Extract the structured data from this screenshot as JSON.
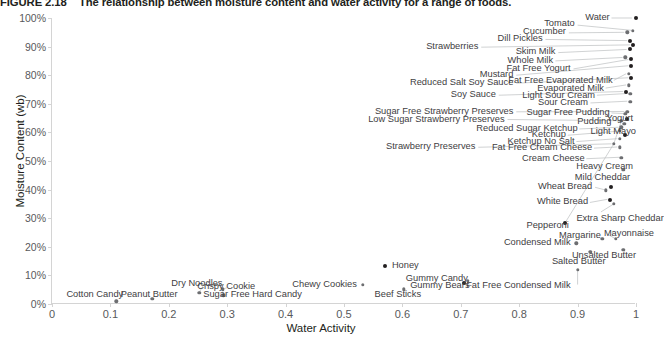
{
  "caption": {
    "figure_number": "FIGURE 2.18",
    "text": "The relationship between moisture content and water activity for a range of foods."
  },
  "chart_data": {
    "type": "scatter",
    "title": "The relationship between moisture content and water activity for a range of foods.",
    "xlabel": "Water Activity",
    "ylabel": "Moisture Content (wb)",
    "xlim": [
      0,
      1
    ],
    "ylim": [
      0,
      1
    ],
    "grid": false,
    "legend": "none",
    "xticks": [
      "0",
      "0.1",
      "0.2",
      "0.3",
      "0.4",
      "0.5",
      "0.6",
      "0.7",
      "0.8",
      "0.9",
      "1"
    ],
    "xtick_values": [
      0,
      0.1,
      0.2,
      0.3,
      0.4,
      0.5,
      0.6,
      0.7,
      0.8,
      0.9,
      1.0
    ],
    "yticks": [
      "0%",
      "10%",
      "20%",
      "30%",
      "40%",
      "50%",
      "60%",
      "70%",
      "80%",
      "90%",
      "100%"
    ],
    "ytick_values": [
      0,
      0.1,
      0.2,
      0.3,
      0.4,
      0.5,
      0.6,
      0.7,
      0.8,
      0.9,
      1.0
    ],
    "marker_color": "#6d6e71",
    "points": [
      {
        "name": "Water",
        "x": 1.0,
        "y": 1.0,
        "dark": true
      },
      {
        "name": "Tomato",
        "x": 0.995,
        "y": 0.955,
        "dark": false
      },
      {
        "name": "Cucumber",
        "x": 0.985,
        "y": 0.95,
        "dark": false
      },
      {
        "name": "Dill Pickles",
        "x": 0.99,
        "y": 0.92,
        "dark": true
      },
      {
        "name": "Strawberries",
        "x": 0.995,
        "y": 0.905,
        "dark": true
      },
      {
        "name": "Skim Milk",
        "x": 0.99,
        "y": 0.89,
        "dark": true
      },
      {
        "name": "Whole Milk",
        "x": 0.982,
        "y": 0.862,
        "dark": false
      },
      {
        "name": "Fat Free Yogurt",
        "x": 0.992,
        "y": 0.855,
        "dark": true
      },
      {
        "name": "Mustard",
        "x": 0.992,
        "y": 0.832,
        "dark": true
      },
      {
        "name": "Fat Free Evaporated Milk",
        "x": 0.988,
        "y": 0.805,
        "dark": false
      },
      {
        "name": "Reduced Salt Soy Sauce",
        "x": 0.992,
        "y": 0.79,
        "dark": true
      },
      {
        "name": "Evaporated Milk",
        "x": 0.988,
        "y": 0.765,
        "dark": false
      },
      {
        "name": "Soy Sauce",
        "x": 0.983,
        "y": 0.742,
        "dark": true
      },
      {
        "name": "Light Sour Cream",
        "x": 0.99,
        "y": 0.735,
        "dark": false
      },
      {
        "name": "Sour Cream",
        "x": 0.99,
        "y": 0.708,
        "dark": false
      },
      {
        "name": "Sugar Free Strawberry Preserves",
        "x": 0.985,
        "y": 0.672,
        "dark": false
      },
      {
        "name": "Sugar Free Pudding",
        "x": 0.982,
        "y": 0.665,
        "dark": false
      },
      {
        "name": "Yogurt",
        "x": 0.985,
        "y": 0.648,
        "dark": true
      },
      {
        "name": "Low Sugar Strawberry Preserves",
        "x": 0.975,
        "y": 0.64,
        "dark": false
      },
      {
        "name": "Pudding",
        "x": 0.98,
        "y": 0.63,
        "dark": false
      },
      {
        "name": "Reduced Sugar Ketchup",
        "x": 0.975,
        "y": 0.618,
        "dark": false
      },
      {
        "name": "Ketchup",
        "x": 0.972,
        "y": 0.605,
        "dark": false
      },
      {
        "name": "Light Mayo",
        "x": 0.982,
        "y": 0.592,
        "dark": true
      },
      {
        "name": "Ketchup No Salt",
        "x": 0.972,
        "y": 0.578,
        "dark": false
      },
      {
        "name": "Strawberry Preserves",
        "x": 0.962,
        "y": 0.56,
        "dark": false
      },
      {
        "name": "Fat Free Cream Cheese",
        "x": 0.972,
        "y": 0.548,
        "dark": false
      },
      {
        "name": "Cream Cheese",
        "x": 0.975,
        "y": 0.512,
        "dark": false
      },
      {
        "name": "Heavy Cream",
        "x": 0.978,
        "y": 0.47,
        "dark": false
      },
      {
        "name": "Mild Cheddar",
        "x": 0.958,
        "y": 0.408,
        "dark": true
      },
      {
        "name": "Wheat Bread",
        "x": 0.948,
        "y": 0.398,
        "dark": false
      },
      {
        "name": "White Bread",
        "x": 0.955,
        "y": 0.365,
        "dark": true
      },
      {
        "name": "Extra Sharp Cheddar",
        "x": 0.962,
        "y": 0.35,
        "dark": false
      },
      {
        "name": "Pepperoni",
        "x": 0.878,
        "y": 0.282,
        "dark": true
      },
      {
        "name": "Margarine",
        "x": 0.942,
        "y": 0.228,
        "dark": false
      },
      {
        "name": "Mayonnaise",
        "x": 0.965,
        "y": 0.228,
        "dark": false
      },
      {
        "name": "Condensed Milk",
        "x": 0.898,
        "y": 0.212,
        "dark": false
      },
      {
        "name": "Unsalted Butter",
        "x": 0.978,
        "y": 0.19,
        "dark": false
      },
      {
        "name": "Salted Butter",
        "x": 0.922,
        "y": 0.182,
        "dark": false
      },
      {
        "name": "Honey",
        "x": 0.57,
        "y": 0.132,
        "dark": true
      },
      {
        "name": "Fat Free Condensed Milk",
        "x": 0.9,
        "y": 0.12,
        "dark": false
      },
      {
        "name": "Gummy Candy",
        "x": 0.712,
        "y": 0.082,
        "dark": false
      },
      {
        "name": "Gummy Bears",
        "x": 0.705,
        "y": 0.072,
        "dark": true
      },
      {
        "name": "Chewy Cookies",
        "x": 0.532,
        "y": 0.068,
        "dark": false
      },
      {
        "name": "Beef Sticks",
        "x": 0.602,
        "y": 0.052,
        "dark": false
      },
      {
        "name": "Crispy Cookie",
        "x": 0.292,
        "y": 0.052,
        "dark": false
      },
      {
        "name": "Dry Noodles",
        "x": 0.252,
        "y": 0.04,
        "dark": false
      },
      {
        "name": "Sugar Free Hard Candy",
        "x": 0.293,
        "y": 0.03,
        "dark": false
      },
      {
        "name": "Peanut Butter",
        "x": 0.172,
        "y": 0.018,
        "dark": false
      },
      {
        "name": "Cotton Candy",
        "x": 0.11,
        "y": 0.01,
        "dark": false
      }
    ],
    "labels": [
      {
        "text": "Water",
        "lx": 0.955,
        "ly": 1.0,
        "align": "r",
        "px": 1.0,
        "py": 1.0
      },
      {
        "text": "Tomato",
        "lx": 0.895,
        "ly": 0.978,
        "align": "r",
        "px": 0.995,
        "py": 0.955
      },
      {
        "text": "Cucumber",
        "lx": 0.88,
        "ly": 0.95,
        "align": "r",
        "px": 0.985,
        "py": 0.95
      },
      {
        "text": "Dill Pickles",
        "lx": 0.84,
        "ly": 0.928,
        "align": "r",
        "px": 0.99,
        "py": 0.92
      },
      {
        "text": "Strawberries",
        "lx": 0.73,
        "ly": 0.898,
        "align": "r",
        "px": 0.995,
        "py": 0.905
      },
      {
        "text": "Skim Milk",
        "lx": 0.862,
        "ly": 0.88,
        "align": "r",
        "px": 0.99,
        "py": 0.89
      },
      {
        "text": "Whole Milk",
        "lx": 0.858,
        "ly": 0.85,
        "align": "r",
        "px": 0.982,
        "py": 0.862
      },
      {
        "text": "Fat Free Yogurt",
        "lx": 0.888,
        "ly": 0.822,
        "align": "r",
        "px": 0.992,
        "py": 0.855
      },
      {
        "text": "Mustard",
        "lx": 0.79,
        "ly": 0.8,
        "align": "r",
        "px": 0.992,
        "py": 0.832
      },
      {
        "text": "Fat Free Evaporated Milk",
        "lx": 0.96,
        "ly": 0.778,
        "align": "r",
        "px": 0.988,
        "py": 0.805
      },
      {
        "text": "Reduced Salt Soy Sauce",
        "lx": 0.79,
        "ly": 0.772,
        "align": "r",
        "px": 0.992,
        "py": 0.79
      },
      {
        "text": "Evaporated Milk",
        "lx": 0.945,
        "ly": 0.752,
        "align": "r",
        "px": 0.988,
        "py": 0.765
      },
      {
        "text": "Soy Sauce",
        "lx": 0.76,
        "ly": 0.73,
        "align": "r",
        "px": 0.983,
        "py": 0.742
      },
      {
        "text": "Light Sour Cream",
        "lx": 0.93,
        "ly": 0.728,
        "align": "r",
        "px": 0.99,
        "py": 0.735
      },
      {
        "text": "Sour Cream",
        "lx": 0.918,
        "ly": 0.702,
        "align": "r",
        "px": 0.99,
        "py": 0.708
      },
      {
        "text": "Sugar Free Strawberry Preserves",
        "lx": 0.79,
        "ly": 0.672,
        "align": "r",
        "px": 0.985,
        "py": 0.672
      },
      {
        "text": "Sugar Free Pudding",
        "lx": 0.955,
        "ly": 0.668,
        "align": "r",
        "px": 0.982,
        "py": 0.665
      },
      {
        "text": "Yogurt",
        "lx": 0.995,
        "ly": 0.648,
        "align": "r",
        "px": 0.985,
        "py": 0.648
      },
      {
        "text": "Low Sugar Strawberry Preserves",
        "lx": 0.775,
        "ly": 0.645,
        "align": "r",
        "px": 0.975,
        "py": 0.64
      },
      {
        "text": "Pudding",
        "lx": 0.958,
        "ly": 0.635,
        "align": "r",
        "px": 0.98,
        "py": 0.63
      },
      {
        "text": "Reduced Sugar Ketchup",
        "lx": 0.9,
        "ly": 0.612,
        "align": "r",
        "px": 0.975,
        "py": 0.618
      },
      {
        "text": "Ketchup",
        "lx": 0.88,
        "ly": 0.59,
        "align": "r",
        "px": 0.972,
        "py": 0.605
      },
      {
        "text": "Light Mayo",
        "lx": 1.0,
        "ly": 0.6,
        "align": "r",
        "px": 0.982,
        "py": 0.592
      },
      {
        "text": "Ketchup No Salt",
        "lx": 0.895,
        "ly": 0.568,
        "align": "r",
        "px": 0.972,
        "py": 0.578
      },
      {
        "text": "Strawberry Preserves",
        "lx": 0.725,
        "ly": 0.548,
        "align": "r",
        "px": 0.962,
        "py": 0.56
      },
      {
        "text": "Fat Free Cream Cheese",
        "lx": 0.925,
        "ly": 0.545,
        "align": "r",
        "px": 0.972,
        "py": 0.548
      },
      {
        "text": "Cream Cheese",
        "lx": 0.912,
        "ly": 0.508,
        "align": "r",
        "px": 0.975,
        "py": 0.512
      },
      {
        "text": "Heavy Cream",
        "lx": 0.995,
        "ly": 0.478,
        "align": "r",
        "px": 0.978,
        "py": 0.47
      },
      {
        "text": "Mild Cheddar",
        "lx": 0.99,
        "ly": 0.442,
        "align": "r",
        "px": 0.958,
        "py": 0.408
      },
      {
        "text": "Wheat Bread",
        "lx": 0.925,
        "ly": 0.408,
        "align": "r",
        "px": 0.948,
        "py": 0.398
      },
      {
        "text": "White Bread",
        "lx": 0.918,
        "ly": 0.355,
        "align": "r",
        "px": 0.955,
        "py": 0.365
      },
      {
        "text": "Extra Sharp Cheddar",
        "lx": 0.898,
        "ly": 0.298,
        "align": "l",
        "px": 0.962,
        "py": 0.35
      },
      {
        "text": "Pepperoni",
        "lx": 0.885,
        "ly": 0.272,
        "align": "r",
        "px": 0.878,
        "py": 0.282
      },
      {
        "text": "Margarine",
        "lx": 0.94,
        "ly": 0.238,
        "align": "r",
        "px": 0.942,
        "py": 0.228
      },
      {
        "text": "Mayonnaise",
        "lx": 0.945,
        "ly": 0.245,
        "align": "l",
        "px": 0.965,
        "py": 0.228
      },
      {
        "text": "Condensed Milk",
        "lx": 0.888,
        "ly": 0.212,
        "align": "r",
        "px": 0.898,
        "py": 0.212
      },
      {
        "text": "Unsalted Butter",
        "lx": 1.0,
        "ly": 0.168,
        "align": "r",
        "px": 0.978,
        "py": 0.19
      },
      {
        "text": "Salted Butter",
        "lx": 0.948,
        "ly": 0.148,
        "align": "r",
        "px": 0.922,
        "py": 0.182
      },
      {
        "text": "Honey",
        "lx": 0.582,
        "ly": 0.132,
        "align": "l",
        "px": 0.57,
        "py": 0.132
      },
      {
        "text": "Fat Free Condensed Milk",
        "lx": 0.888,
        "ly": 0.062,
        "align": "r",
        "px": 0.9,
        "py": 0.12
      },
      {
        "text": "Gummy Candy",
        "lx": 0.712,
        "ly": 0.088,
        "align": "r",
        "px": 0.712,
        "py": 0.082
      },
      {
        "text": "Gummy Bears",
        "lx": 0.715,
        "ly": 0.062,
        "align": "r",
        "px": 0.705,
        "py": 0.072
      },
      {
        "text": "Chewy Cookies",
        "lx": 0.522,
        "ly": 0.068,
        "align": "r",
        "px": 0.532,
        "py": 0.068
      },
      {
        "text": "Beef Sticks",
        "lx": 0.632,
        "ly": 0.03,
        "align": "r",
        "px": 0.602,
        "py": 0.052
      },
      {
        "text": "Crispy Cookie",
        "lx": 0.348,
        "ly": 0.06,
        "align": "r",
        "px": 0.292,
        "py": 0.052
      },
      {
        "text": "Dry Noodles",
        "lx": 0.292,
        "ly": 0.07,
        "align": "r",
        "px": 0.252,
        "py": 0.04
      },
      {
        "text": "Sugar Free Hard Candy",
        "lx": 0.428,
        "ly": 0.03,
        "align": "r",
        "px": 0.293,
        "py": 0.03
      },
      {
        "text": "Peanut Butter",
        "lx": 0.215,
        "ly": 0.03,
        "align": "r",
        "px": 0.172,
        "py": 0.018
      },
      {
        "text": "Cotton Candy",
        "lx": 0.122,
        "ly": 0.03,
        "align": "r",
        "px": 0.11,
        "py": 0.01
      }
    ],
    "leaders": [
      {
        "x1": 0.958,
        "y1": 1.0,
        "x2": 0.993,
        "y2": 1.0
      },
      {
        "x1": 0.9,
        "y1": 0.975,
        "x2": 0.992,
        "y2": 0.957
      },
      {
        "x1": 0.885,
        "y1": 0.948,
        "x2": 0.98,
        "y2": 0.95
      },
      {
        "x1": 0.845,
        "y1": 0.925,
        "x2": 0.985,
        "y2": 0.921
      },
      {
        "x1": 0.735,
        "y1": 0.898,
        "x2": 0.99,
        "y2": 0.906
      },
      {
        "x1": 0.867,
        "y1": 0.879,
        "x2": 0.984,
        "y2": 0.89
      },
      {
        "x1": 0.862,
        "y1": 0.85,
        "x2": 0.977,
        "y2": 0.862
      },
      {
        "x1": 0.893,
        "y1": 0.822,
        "x2": 0.987,
        "y2": 0.855
      },
      {
        "x1": 0.795,
        "y1": 0.8,
        "x2": 0.987,
        "y2": 0.833
      },
      {
        "x1": 0.962,
        "y1": 0.782,
        "x2": 0.983,
        "y2": 0.805
      },
      {
        "x1": 0.795,
        "y1": 0.772,
        "x2": 0.987,
        "y2": 0.791
      },
      {
        "x1": 0.948,
        "y1": 0.755,
        "x2": 0.983,
        "y2": 0.766
      },
      {
        "x1": 0.765,
        "y1": 0.73,
        "x2": 0.978,
        "y2": 0.743
      },
      {
        "x1": 0.933,
        "y1": 0.73,
        "x2": 0.985,
        "y2": 0.736
      },
      {
        "x1": 0.922,
        "y1": 0.703,
        "x2": 0.985,
        "y2": 0.709
      },
      {
        "x1": 0.795,
        "y1": 0.672,
        "x2": 0.98,
        "y2": 0.673
      },
      {
        "x1": 0.958,
        "y1": 0.668,
        "x2": 0.978,
        "y2": 0.666
      },
      {
        "x1": 0.78,
        "y1": 0.645,
        "x2": 0.97,
        "y2": 0.641
      },
      {
        "x1": 0.903,
        "y1": 0.612,
        "x2": 0.97,
        "y2": 0.618
      },
      {
        "x1": 0.883,
        "y1": 0.59,
        "x2": 0.968,
        "y2": 0.604
      },
      {
        "x1": 0.898,
        "y1": 0.568,
        "x2": 0.968,
        "y2": 0.578
      },
      {
        "x1": 0.73,
        "y1": 0.548,
        "x2": 0.958,
        "y2": 0.56
      },
      {
        "x1": 0.928,
        "y1": 0.545,
        "x2": 0.968,
        "y2": 0.549
      },
      {
        "x1": 0.915,
        "y1": 0.508,
        "x2": 0.971,
        "y2": 0.513
      },
      {
        "x1": 0.975,
        "y1": 0.478,
        "x2": 0.976,
        "y2": 0.472
      },
      {
        "x1": 0.93,
        "y1": 0.408,
        "x2": 0.945,
        "y2": 0.4
      },
      {
        "x1": 0.921,
        "y1": 0.355,
        "x2": 0.951,
        "y2": 0.366
      },
      {
        "x1": 0.9,
        "y1": 0.12,
        "x2": 0.9,
        "y2": 0.068
      },
      {
        "x1": 0.922,
        "y1": 0.182,
        "x2": 0.94,
        "y2": 0.155
      },
      {
        "x1": 0.978,
        "y1": 0.19,
        "x2": 0.982,
        "y2": 0.175
      },
      {
        "x1": 0.965,
        "y1": 0.228,
        "x2": 0.952,
        "y2": 0.243
      },
      {
        "x1": 0.962,
        "y1": 0.35,
        "x2": 0.94,
        "y2": 0.322
      },
      {
        "x1": 0.292,
        "y1": 0.052,
        "x2": 0.3,
        "y2": 0.057
      },
      {
        "x1": 0.252,
        "y1": 0.04,
        "x2": 0.258,
        "y2": 0.062
      },
      {
        "x1": 0.293,
        "y1": 0.03,
        "x2": 0.3,
        "y2": 0.033
      },
      {
        "x1": 0.602,
        "y1": 0.052,
        "x2": 0.61,
        "y2": 0.036
      },
      {
        "x1": 0.975,
        "y1": 0.64,
        "x2": 0.962,
        "y2": 0.56
      },
      {
        "x1": 0.962,
        "y1": 0.56,
        "x2": 0.878,
        "y2": 0.282
      }
    ]
  }
}
